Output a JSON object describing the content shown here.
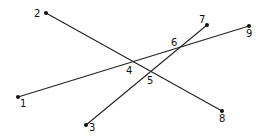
{
  "diagram": {
    "type": "line-intersection",
    "lines": [
      {
        "from": "2",
        "to": "8"
      },
      {
        "from": "1",
        "to": "9"
      },
      {
        "from": "3",
        "to": "7"
      }
    ],
    "points": [
      {
        "label": "1",
        "x": 18,
        "y": 97,
        "lx": 20,
        "ly": 107,
        "endpoint": true
      },
      {
        "label": "2",
        "x": 46,
        "y": 13,
        "lx": 34,
        "ly": 17,
        "endpoint": true
      },
      {
        "label": "3",
        "x": 86,
        "y": 125,
        "lx": 89,
        "ly": 131,
        "endpoint": true
      },
      {
        "label": "4",
        "x": 130,
        "y": 66,
        "lx": 126,
        "ly": 74,
        "endpoint": false
      },
      {
        "label": "5",
        "x": 148,
        "y": 75,
        "lx": 147,
        "ly": 84,
        "endpoint": false
      },
      {
        "label": "6",
        "x": 178,
        "y": 48,
        "lx": 171,
        "ly": 46,
        "endpoint": false
      },
      {
        "label": "7",
        "x": 207,
        "y": 25,
        "lx": 199,
        "ly": 23,
        "endpoint": true
      },
      {
        "label": "8",
        "x": 222,
        "y": 111,
        "lx": 219,
        "ly": 122,
        "endpoint": true
      },
      {
        "label": "9",
        "x": 249,
        "y": 26,
        "lx": 246,
        "ly": 37,
        "endpoint": true
      }
    ],
    "colors": {
      "line": "#222222",
      "dot": "#111111",
      "background": "#ffffff"
    }
  }
}
